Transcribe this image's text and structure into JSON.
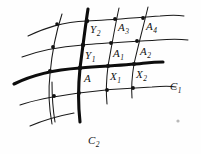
{
  "figure": {
    "background_color": "#fefefe",
    "ink_color": "#141414",
    "thick_stroke_color": "#0d0d0d",
    "width": 201,
    "height": 154
  },
  "labels": {
    "point_a": {
      "text": "A",
      "sub": "",
      "x": 84,
      "y": 73
    },
    "point_x1": {
      "text": "X",
      "sub": "1",
      "x": 110,
      "y": 71
    },
    "point_x2": {
      "text": "X",
      "sub": "2",
      "x": 136,
      "y": 69
    },
    "point_y1": {
      "text": "Y",
      "sub": "1",
      "x": 85,
      "y": 50
    },
    "point_y2": {
      "text": "Y",
      "sub": "2",
      "x": 90,
      "y": 24
    },
    "point_a1": {
      "text": "A",
      "sub": "1",
      "x": 113,
      "y": 48
    },
    "point_a2": {
      "text": "A",
      "sub": "2",
      "x": 140,
      "y": 46
    },
    "point_a3": {
      "text": "A",
      "sub": "3",
      "x": 118,
      "y": 22
    },
    "point_a4": {
      "text": "A",
      "sub": "4",
      "x": 146,
      "y": 21
    },
    "curve_c1": {
      "text": "C",
      "sub": "1",
      "x": 170,
      "y": 81
    },
    "curve_c2": {
      "text": "C",
      "sub": "2",
      "x": 88,
      "y": 135
    }
  },
  "curves": {
    "family_u_label": "u-parameter curves",
    "family_v_label": "v-parameter curves",
    "distinguished": [
      "C1",
      "C2"
    ],
    "intersection_point": "A"
  },
  "nodes": [
    {
      "name": "A",
      "x": 80,
      "y": 68
    },
    {
      "name": "X1",
      "x": 108,
      "y": 66
    },
    {
      "name": "X2",
      "x": 134,
      "y": 64
    },
    {
      "name": "Y1",
      "x": 83,
      "y": 45
    },
    {
      "name": "Y2",
      "x": 87,
      "y": 21
    },
    {
      "name": "A1",
      "x": 111,
      "y": 43
    },
    {
      "name": "A2",
      "x": 137,
      "y": 41
    },
    {
      "name": "A3",
      "x": 115,
      "y": 19
    },
    {
      "name": "A4",
      "x": 143,
      "y": 18
    },
    {
      "name": "L1",
      "x": 53,
      "y": 47
    },
    {
      "name": "L2",
      "x": 49,
      "y": 71
    },
    {
      "name": "L3",
      "x": 57,
      "y": 24
    },
    {
      "name": "B1",
      "x": 54,
      "y": 96
    },
    {
      "name": "B2",
      "x": 79,
      "y": 93
    },
    {
      "name": "B3",
      "x": 107,
      "y": 90
    },
    {
      "name": "B4",
      "x": 133,
      "y": 88
    }
  ]
}
